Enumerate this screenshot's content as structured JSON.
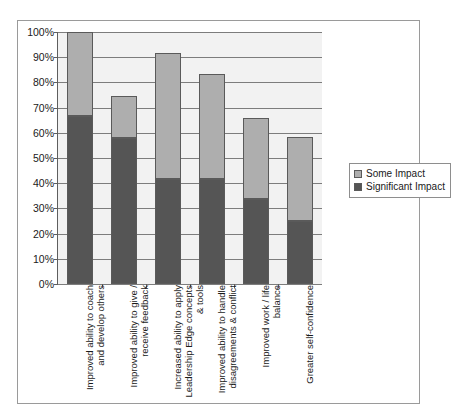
{
  "chart_data": {
    "type": "bar",
    "title": "",
    "subtitle": "",
    "xlabel": "",
    "ylabel": "",
    "stacked": true,
    "grid": true,
    "legend_position": "right",
    "ylim": [
      0,
      100
    ],
    "ytick_labels": [
      "100%",
      "90%",
      "80%",
      "70%",
      "60%",
      "50%",
      "40%",
      "30%",
      "20%",
      "10%",
      "0%"
    ],
    "ytick_values": [
      100,
      90,
      80,
      70,
      60,
      50,
      40,
      30,
      20,
      10,
      0
    ],
    "categories": [
      "Improved ability to coach and develop others",
      "Improved ability to give / receive feedback",
      "Increased ability to apply Leadership Edge concepts & tools",
      "Improved ability to handle disagreements & conflict",
      "Improved work / life balance",
      "Greater self-confidence"
    ],
    "series": [
      {
        "name": "Significant Impact",
        "color": "#555555",
        "values": [
          66.7,
          57.9,
          41.7,
          41.7,
          33.7,
          25.0
        ]
      },
      {
        "name": "Some Impact",
        "color": "#aeaeae",
        "values": [
          33.3,
          16.7,
          50.0,
          41.6,
          32.3,
          33.3
        ]
      }
    ],
    "totals": [
      100.0,
      74.6,
      91.7,
      83.3,
      66.0,
      58.3
    ]
  },
  "legend": {
    "entries": [
      {
        "label": "Some Impact",
        "color": "#aeaeae"
      },
      {
        "label": "Significant Impact",
        "color": "#555555"
      }
    ]
  },
  "colors": {
    "some_impact": "#aeaeae",
    "significant_impact": "#555555",
    "plot_background": "#f2f2f2",
    "gridline": "#7d7d7d",
    "axis": "#5e5e5e",
    "frame": "#9a9a9a"
  }
}
